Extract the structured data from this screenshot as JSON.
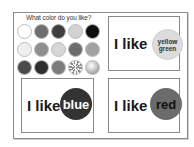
{
  "worksheet": {
    "question": "What color do you like?",
    "palette": [
      {
        "name": "white",
        "color": "#ffffff"
      },
      {
        "name": "red",
        "color": "#6e6e6e"
      },
      {
        "name": "blue",
        "color": "#3e3e3e"
      },
      {
        "name": "yellow",
        "color": "#d2d2d2"
      },
      {
        "name": "black",
        "color": "#0e0e0e"
      },
      {
        "name": "light-pink",
        "color": "#efefef"
      },
      {
        "name": "orange",
        "color": "#8f8f8f"
      },
      {
        "name": "light-yellow",
        "color": "#d6d6d6"
      },
      {
        "name": "green",
        "color": "#6c6c6c"
      },
      {
        "name": "pink",
        "color": "#a2a2a2"
      },
      {
        "name": "purple",
        "color": "#4a4a4a"
      },
      {
        "name": "dark-blue",
        "color": "#2e2e2e"
      },
      {
        "name": "brown",
        "color": "#7c7c7c"
      },
      {
        "name": "silver",
        "color": "#c0c0c0",
        "pattern": "metallic-rays"
      },
      {
        "name": "gold",
        "color": "#b8b8b8",
        "pattern": "metallic-sphere"
      }
    ],
    "cards": [
      {
        "id": "yellow-green",
        "prefix": "I like",
        "color_line1": "yellow",
        "color_line2": "green"
      },
      {
        "id": "blue",
        "prefix": "I like",
        "color_word": "blue"
      },
      {
        "id": "red",
        "prefix": "I like",
        "color_word": "red"
      }
    ]
  }
}
